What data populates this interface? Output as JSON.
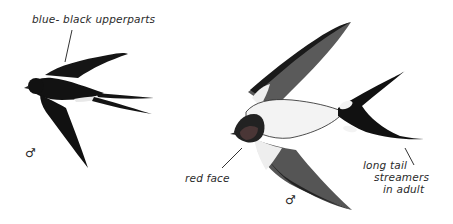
{
  "illustration": {
    "subject": "Barn swallow field-guide plate",
    "birds": [
      {
        "id": "small-swallow",
        "view": "upperside in flight",
        "sex_symbol": "♂",
        "annotation": "blue- black upperparts"
      },
      {
        "id": "large-swallow",
        "view": "underside in flight",
        "sex_symbol": "♂",
        "annotations": [
          "red face",
          "long tail",
          "streamers",
          "in adult"
        ]
      }
    ],
    "colors": {
      "background": "#ffffff",
      "plumage_dark": "#111111",
      "wing_gray": "#555555",
      "underparts": "#f2f2f2",
      "face": "#3a2a2a",
      "ink": "#2a2a2a"
    }
  },
  "labels": {
    "upperparts": "blue- black upperparts",
    "red_face": "red face",
    "tail_line1": "long tail",
    "tail_line2": "streamers",
    "tail_line3": "in adult",
    "male_left": "♂",
    "male_right": "♂"
  }
}
